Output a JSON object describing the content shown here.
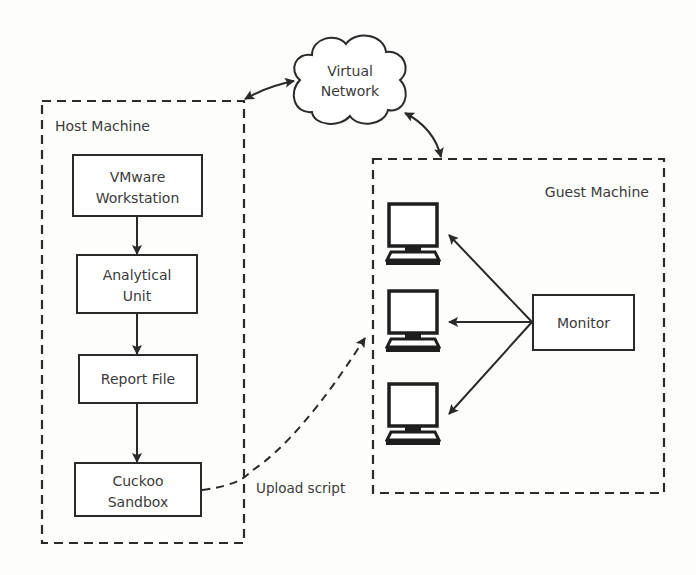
{
  "diagram": {
    "cloud": {
      "line1": "Virtual",
      "line2": "Network"
    },
    "host": {
      "title": "Host Machine",
      "nodes": [
        {
          "line1": "VMware",
          "line2": "Workstation"
        },
        {
          "line1": "Analytical",
          "line2": "Unit"
        },
        {
          "line1": "Report File",
          "line2": ""
        },
        {
          "line1": "Cuckoo",
          "line2": "Sandbox"
        }
      ]
    },
    "guest": {
      "title": "Guest Machine",
      "monitor_label": "Monitor",
      "computers": [
        "computer-1",
        "computer-2",
        "computer-3"
      ]
    },
    "edges": {
      "upload_label": "Upload script"
    },
    "colors": {
      "stroke": "#2a2a2a",
      "text": "#3a3a3a",
      "background": "#fdfdfc"
    }
  }
}
